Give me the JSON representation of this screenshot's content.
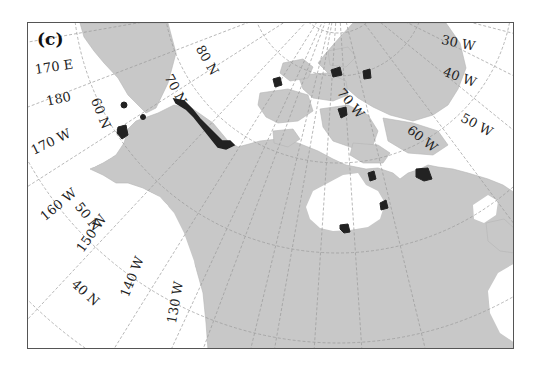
{
  "figure": {
    "panel_label": "(c)",
    "colors": {
      "land": "#c8c8c8",
      "ocean": "#ffffff",
      "graticule": "#999999",
      "highlight": "#222222",
      "frame": "#555555"
    }
  },
  "latitude_labels": [
    {
      "text": "80 N"
    },
    {
      "text": "70 N"
    },
    {
      "text": "60 N"
    },
    {
      "text": "50 N"
    },
    {
      "text": "40 N"
    }
  ],
  "longitude_labels": [
    {
      "text": "170 E"
    },
    {
      "text": "180"
    },
    {
      "text": "170 W"
    },
    {
      "text": "160 W"
    },
    {
      "text": "150 W"
    },
    {
      "text": "140 W"
    },
    {
      "text": "130 W"
    },
    {
      "text": "70 W"
    },
    {
      "text": "60 W"
    },
    {
      "text": "50 W"
    },
    {
      "text": "40 W"
    },
    {
      "text": "30 W"
    }
  ],
  "highlighted_regions": [
    {
      "name": "Alaska North Slope coast"
    },
    {
      "name": "St. Lawrence Island"
    },
    {
      "name": "Seward Peninsula"
    },
    {
      "name": "Western Alaska coast"
    },
    {
      "name": "Ellesmere Island"
    },
    {
      "name": "Northwest Greenland"
    },
    {
      "name": "Baffin Island north"
    },
    {
      "name": "Victoria Island"
    },
    {
      "name": "Southampton Island"
    },
    {
      "name": "Ungava Peninsula"
    },
    {
      "name": "Hudson Bay west coast"
    }
  ]
}
